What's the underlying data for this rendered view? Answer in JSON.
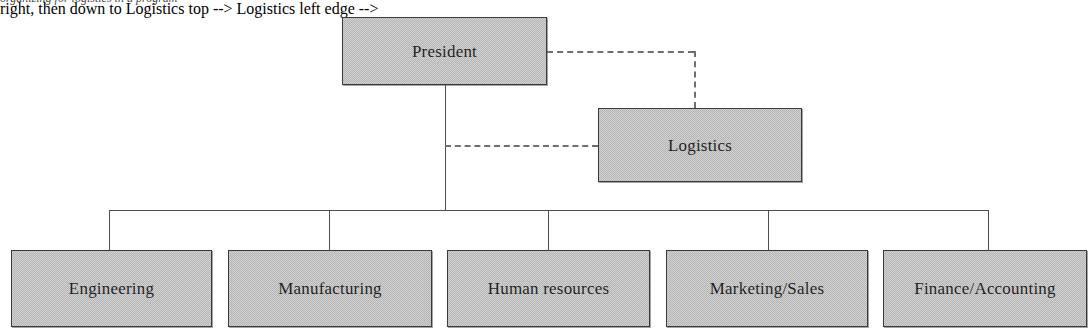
{
  "diagram": {
    "caption_fragment": "organizing for logistics in a program",
    "colors": {
      "box_fill": "#b5b5b5",
      "box_border": "#3a3a3a",
      "line": "#4d4d4d",
      "dashed_line": "#6f6f6f",
      "text": "#1d1d1d",
      "background": "#ffffff"
    },
    "nodes": {
      "president": {
        "label": "President",
        "level": "top",
        "x": 342,
        "y": 17,
        "w": 205,
        "h": 68
      },
      "logistics": {
        "label": "Logistics",
        "level": "staff",
        "relationship": "dashed",
        "x": 598,
        "y": 108,
        "w": 204,
        "h": 74
      }
    },
    "departments": [
      {
        "label": "Engineering",
        "x": 11,
        "y": 250,
        "w": 201,
        "h": 77,
        "drop_x": 109
      },
      {
        "label": "Manufacturing",
        "x": 228,
        "y": 250,
        "w": 204,
        "h": 77,
        "drop_x": 329
      },
      {
        "label": "Human resources",
        "x": 447,
        "y": 250,
        "w": 203,
        "h": 77,
        "drop_x": 548
      },
      {
        "label": "Marketing/Sales",
        "x": 666,
        "y": 250,
        "w": 202,
        "h": 77,
        "drop_x": 768
      },
      {
        "label": "Finance/Accounting",
        "x": 883,
        "y": 250,
        "w": 204,
        "h": 77,
        "drop_x": 988
      }
    ],
    "connectors": {
      "trunk_x": 445,
      "trunk_top": 85,
      "bus_y": 210,
      "bus_left": 109,
      "bus_right": 988,
      "dept_top": 250,
      "dashed_right_y": 51,
      "dashed_right_from_x": 547,
      "dashed_right_to_x": 694,
      "dashed_down_top": 51,
      "dashed_down_bottom": 108,
      "dashed_left_y": 145,
      "dashed_left_from_x": 445,
      "dashed_left_to_x": 598
    }
  }
}
